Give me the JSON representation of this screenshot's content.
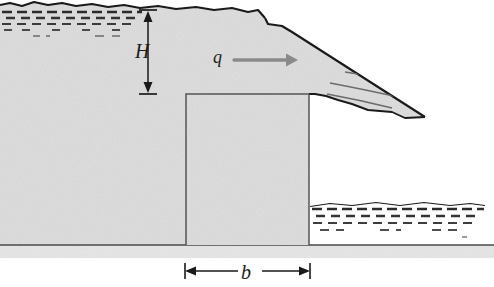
{
  "figure": {
    "type": "engineering-cross-section",
    "width": 494,
    "height": 287,
    "labels": {
      "height_symbol": "H",
      "width_symbol": "b",
      "load_symbol": "q"
    },
    "colors": {
      "soil_fill": "#dcdcdc",
      "soil_fill_dark": "#d2d2d2",
      "ground_band": "#e4e4e4",
      "outline": "#1a1a1a",
      "hatch": "#2b2b2b",
      "arrow_gray": "#8a8a8a",
      "thin_line": "#6b6b6b",
      "background": "#ffffff"
    },
    "geometry": {
      "ground_line_y": 245,
      "ground_band_bottom_y": 258,
      "block_left_x": 186,
      "block_right_x": 309,
      "block_top_y": 94,
      "block_bottom_y": 245,
      "crest_top_y": 12,
      "slope_toe_x": 425,
      "tailwater_left_x": 310,
      "tailwater_right_x": 485,
      "tailwater_top_y": 203
    },
    "dimension_lines": [
      {
        "name": "H",
        "orientation": "vertical",
        "x": 148,
        "y_top": 12,
        "y_bottom": 92,
        "label": "H"
      },
      {
        "name": "b",
        "orientation": "horizontal",
        "y": 271,
        "x_left": 186,
        "x_right": 309,
        "label": "b"
      }
    ],
    "load_arrow": {
      "label": "q",
      "x_start": 234,
      "x_end": 296,
      "y": 60,
      "direction": "right"
    },
    "water_regions": [
      {
        "name": "upper-reservoir",
        "x_left": 0,
        "x_right": 142,
        "y_top": 8,
        "rows": 3
      },
      {
        "name": "tailwater",
        "x_left": 310,
        "x_right": 485,
        "y_top": 203,
        "rows": 4
      }
    ],
    "strata_lines": 3
  }
}
